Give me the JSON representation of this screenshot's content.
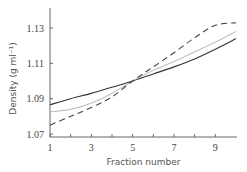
{
  "chart_data": {
    "type": "line",
    "title": "",
    "xlabel": "Fraction number",
    "ylabel": "Density (g ml⁻¹)",
    "xlim": [
      1,
      10
    ],
    "ylim": [
      1.07,
      1.135
    ],
    "x_ticks": [
      1,
      3,
      5,
      7,
      9
    ],
    "x_minor_ticks": [
      2,
      4,
      6,
      8
    ],
    "x_tick_labels": [
      "1",
      "3",
      "5",
      "7",
      "9"
    ],
    "y_ticks": [
      1.07,
      1.09,
      1.11,
      1.13
    ],
    "y_tick_labels": [
      "1.07",
      "1.09",
      "1.11",
      "1.13"
    ],
    "grid": false,
    "legend": "none",
    "x": [
      1,
      2,
      3,
      4,
      5,
      6,
      7,
      8,
      9,
      10
    ],
    "series": [
      {
        "name": "solid",
        "style": "solid",
        "color": "#333333",
        "values": [
          1.0865,
          1.09,
          1.093,
          1.0965,
          1.1,
          1.104,
          1.108,
          1.1125,
          1.118,
          1.124
        ]
      },
      {
        "name": "gray",
        "style": "solid",
        "color": "#aaaaaa",
        "values": [
          1.0825,
          1.084,
          1.0875,
          1.093,
          1.1,
          1.106,
          1.111,
          1.1165,
          1.122,
          1.128
        ]
      },
      {
        "name": "dashed",
        "style": "dashed",
        "color": "#444444",
        "values": [
          1.075,
          1.08,
          1.085,
          1.091,
          1.1,
          1.108,
          1.116,
          1.1245,
          1.1315,
          1.133
        ]
      }
    ]
  }
}
